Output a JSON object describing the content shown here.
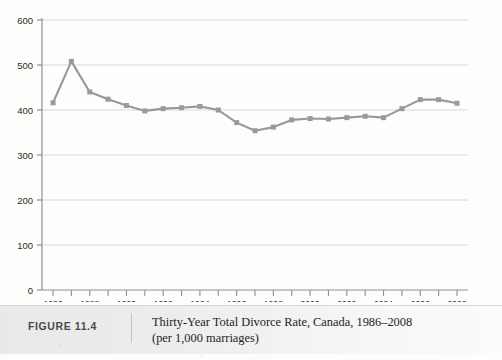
{
  "figure": {
    "number_label": "FIGURE 11.4",
    "caption_line1": "Thirty-Year Total Divorce Rate, Canada, 1986–2008",
    "caption_line2": "(per 1,000 marriages)"
  },
  "chart_data": {
    "type": "line",
    "title": "Thirty-Year Total Divorce Rate, Canada, 1986–2008",
    "subtitle": "(per 1,000 marriages)",
    "xlabel": "",
    "ylabel": "",
    "x": [
      1986,
      1987,
      1988,
      1989,
      1990,
      1991,
      1992,
      1993,
      1994,
      1995,
      1996,
      1997,
      1998,
      1999,
      2000,
      2001,
      2002,
      2003,
      2004,
      2005,
      2006,
      2007,
      2008
    ],
    "values": [
      416,
      508,
      440,
      424,
      410,
      398,
      403,
      405,
      408,
      400,
      372,
      354,
      362,
      378,
      381,
      380,
      383,
      386,
      383,
      403,
      423,
      423,
      415
    ],
    "series": [
      {
        "name": "Thirty-Year Total Divorce Rate",
        "values": [
          416,
          508,
          440,
          424,
          410,
          398,
          403,
          405,
          408,
          400,
          372,
          354,
          362,
          378,
          381,
          380,
          383,
          386,
          383,
          403,
          423,
          423,
          415
        ]
      }
    ],
    "xtick_labels": [
      "1986",
      "1988",
      "1990",
      "1992",
      "1994",
      "1996",
      "1998",
      "2000",
      "2002",
      "2004",
      "2006",
      "2008"
    ],
    "xtick_values": [
      1986,
      1988,
      1990,
      1992,
      1994,
      1996,
      1998,
      2000,
      2002,
      2004,
      2006,
      2008
    ],
    "ytick_labels": [
      "0",
      "100",
      "200",
      "300",
      "400",
      "500",
      "600"
    ],
    "ytick_values": [
      0,
      100,
      200,
      300,
      400,
      500,
      600
    ],
    "xlim": [
      1985.4,
      2008.6
    ],
    "ylim": [
      0,
      600
    ],
    "grid": "horizontal",
    "legend": "none",
    "series_color": "#989898",
    "marker": "square",
    "marker_size": 5
  },
  "colors": {
    "line": "#989898",
    "marker": "#9a9a9a",
    "grid": "#d8d8d8",
    "axis": "#8f8f8f",
    "tick_text": "#2b2b2b",
    "caption_band": "#ececec",
    "caption_text": "#1d1d1d",
    "figure_number_text": "#4a4a4a"
  }
}
